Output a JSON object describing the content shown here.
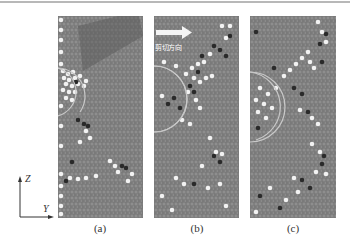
{
  "figure": {
    "panels": [
      {
        "id": "a",
        "caption": "(a)"
      },
      {
        "id": "b",
        "caption": "(b)",
        "arrow_label": "剪切方向"
      },
      {
        "id": "c",
        "caption": "(c)"
      }
    ],
    "axes": {
      "vertical": "Z",
      "horizontal": "Y"
    },
    "colors": {
      "background_atoms": "#7a7a7a",
      "white_atoms": "#f2f2f2",
      "dark_atoms": "#2a2a2a",
      "circle_highlight": "#c8c8c8"
    }
  }
}
